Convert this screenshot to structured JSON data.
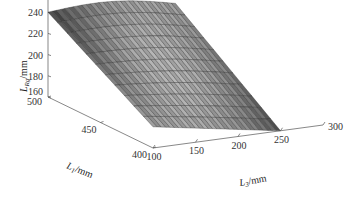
{
  "chart_data": {
    "type": "surface",
    "title": "",
    "xlabel": "L3/mm",
    "xlabel_main": "L",
    "xlabel_sub": "3",
    "xlabel_unit": "/mm",
    "ylabel": "L1/mm",
    "ylabel_main": "L",
    "ylabel_sub": "1",
    "ylabel_unit": "/mm",
    "zlabel": "LRg/mm",
    "zlabel_main": "L",
    "zlabel_sub": "Rg",
    "zlabel_unit": "/mm",
    "x_ticks": [
      "100",
      "150",
      "200",
      "250",
      "300"
    ],
    "y_ticks": [
      "400",
      "450",
      "500"
    ],
    "z_ticks": [
      "160",
      "180",
      "200",
      "220",
      "240",
      "260"
    ],
    "xlim": [
      100,
      300
    ],
    "ylim": [
      400,
      500
    ],
    "zlim": [
      160,
      260
    ],
    "grid": false,
    "colormap": "gray",
    "surface_corners": [
      {
        "x": 100,
        "y": 500,
        "z": 240
      },
      {
        "x": 250,
        "y": 500,
        "z": 232
      },
      {
        "x": 100,
        "y": 400,
        "z": 180
      },
      {
        "x": 250,
        "y": 400,
        "z": 160
      }
    ],
    "x_mesh_count": 30,
    "y_mesh_count": 11
  }
}
